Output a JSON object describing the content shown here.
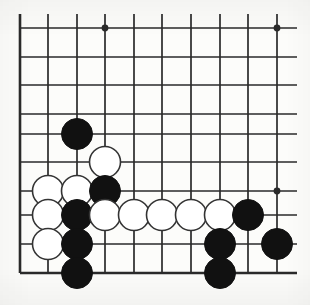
{
  "diagram": {
    "board_style": "line-drawing go diagram, partial board showing lower-left corner area",
    "background_color": "#fcfcfa",
    "line_color": "#2a2a2a",
    "black_stone_color": "#111111",
    "white_stone_color": "#ffffff",
    "white_stone_border_color": "#333333"
  },
  "grid": {
    "columns": 10,
    "rows": 10,
    "x_positions": [
      20,
      48,
      77,
      105,
      134,
      162,
      191,
      220,
      248,
      277
    ],
    "y_positions": [
      28,
      57,
      85,
      114,
      134,
      162,
      191,
      215,
      244,
      273
    ],
    "left_edge_column_index": 0,
    "bottom_edge_row_index": 9,
    "edge_line_width": 2.6,
    "inner_line_width": 1.7,
    "overhang_right_px": 20,
    "overhang_top_px": 14
  },
  "star_points": [
    {
      "col": 3,
      "row": 0,
      "name": "star-point-upper"
    },
    {
      "col": 9,
      "row": 0,
      "name": "star-point-upper-right"
    },
    {
      "col": 9,
      "row": 6,
      "name": "star-point-lower-right"
    }
  ],
  "stones": [
    {
      "col": 2,
      "row": 4,
      "color": "black",
      "label": "black-stone-c2-r4"
    },
    {
      "col": 3,
      "row": 5,
      "color": "white",
      "label": "white-stone-c3-r5"
    },
    {
      "col": 1,
      "row": 6,
      "color": "white",
      "label": "white-stone-c1-r6"
    },
    {
      "col": 2,
      "row": 6,
      "color": "white",
      "label": "white-stone-c2-r6"
    },
    {
      "col": 3,
      "row": 6,
      "color": "black",
      "label": "black-stone-c3-r6"
    },
    {
      "col": 1,
      "row": 7,
      "color": "white",
      "label": "white-stone-c1-r7"
    },
    {
      "col": 2,
      "row": 7,
      "color": "black",
      "label": "black-stone-c2-r7"
    },
    {
      "col": 3,
      "row": 7,
      "color": "white",
      "label": "white-stone-c3-r7"
    },
    {
      "col": 4,
      "row": 7,
      "color": "white",
      "label": "white-stone-c4-r7"
    },
    {
      "col": 5,
      "row": 7,
      "color": "white",
      "label": "white-stone-c5-r7"
    },
    {
      "col": 6,
      "row": 7,
      "color": "white",
      "label": "white-stone-c6-r7"
    },
    {
      "col": 7,
      "row": 7,
      "color": "white",
      "label": "white-stone-c7-r7"
    },
    {
      "col": 8,
      "row": 7,
      "color": "black",
      "label": "black-stone-c8-r7"
    },
    {
      "col": 1,
      "row": 8,
      "color": "white",
      "label": "white-stone-c1-r8"
    },
    {
      "col": 2,
      "row": 8,
      "color": "black",
      "label": "black-stone-c2-r8"
    },
    {
      "col": 7,
      "row": 8,
      "color": "black",
      "label": "black-stone-c7-r8"
    },
    {
      "col": 9,
      "row": 8,
      "color": "black",
      "label": "black-stone-c9-r8"
    },
    {
      "col": 2,
      "row": 9,
      "color": "black",
      "label": "black-stone-c2-r9"
    },
    {
      "col": 7,
      "row": 9,
      "color": "black",
      "label": "black-stone-c7-r9"
    }
  ],
  "stone_radius": 15.5,
  "star_point_radius": 3.4
}
